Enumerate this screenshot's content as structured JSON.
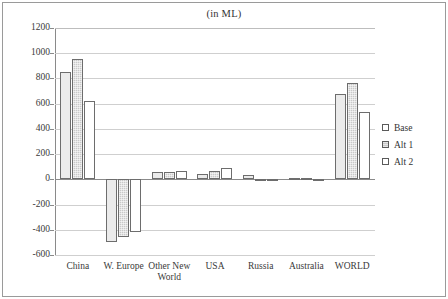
{
  "chart_data": {
    "type": "bar",
    "title": "(in ML)",
    "xlabel": "",
    "ylabel": "",
    "ylim": [
      -600,
      1200
    ],
    "ytick_step": 200,
    "yticks": [
      1200,
      1000,
      800,
      600,
      400,
      200,
      0,
      -200,
      -400,
      -600
    ],
    "grid": true,
    "legend_position": "right",
    "categories": [
      "China",
      "W. Europe",
      "Other New World",
      "USA",
      "Russia",
      "Australia",
      "WORLD"
    ],
    "series": [
      {
        "name": "Base",
        "values": [
          850,
          -500,
          60,
          40,
          35,
          10,
          675
        ]
      },
      {
        "name": "Alt 1",
        "values": [
          955,
          -455,
          62,
          65,
          5,
          8,
          765
        ]
      },
      {
        "name": "Alt 2",
        "values": [
          625,
          -420,
          65,
          90,
          2,
          3,
          530
        ]
      }
    ]
  },
  "legend": {
    "items": [
      {
        "label": "Base",
        "swatch": "legend-swatch-base"
      },
      {
        "label": "Alt 1",
        "swatch": "legend-swatch-alt1"
      },
      {
        "label": "Alt 2",
        "swatch": "legend-swatch-alt2"
      }
    ]
  },
  "colors": {
    "base_fill": "#ebebeb",
    "alt1_fill": "#c9c9c9",
    "alt2_fill": "#ffffff",
    "bar_stroke": "#6d6d6d",
    "gridline": "#cfcfcf",
    "axis": "#8a8a8a",
    "frame": "#9a9a9a",
    "text": "#333333"
  }
}
